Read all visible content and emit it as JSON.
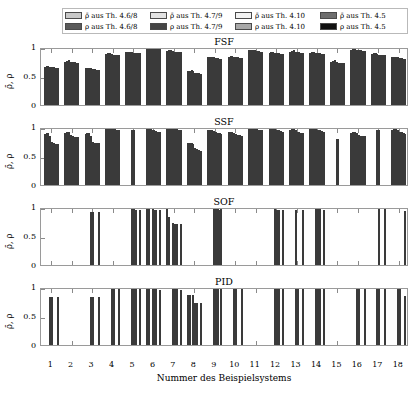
{
  "figure": {
    "xlabel": "Nummer des Beispielsystems",
    "ylabel": "ρ̄, ρ",
    "ytick_labels": [
      "1",
      "0.5",
      "0"
    ],
    "ytick_values": [
      1,
      0.5,
      0
    ]
  },
  "legend": {
    "entries": [
      {
        "label": "ρ̄ aus Th. 4.6/8",
        "color": "#c8c8c8",
        "series": "rhobar_468"
      },
      {
        "label": "ρ̄ aus Th. 4.7/9",
        "color": "#e2e2e2",
        "series": "rhobar_479"
      },
      {
        "label": "ρ̄ aus Th. 4.10",
        "color": "#f2f2f2",
        "series": "rhobar_410"
      },
      {
        "label": "ρ̄ aus Th. 4.5",
        "color": "#6e6e6e",
        "series": "rhobar_45"
      },
      {
        "label": "ρ aus Th. 4.6/8",
        "color": "#5a5a5a",
        "series": "rho_468"
      },
      {
        "label": "ρ aus Th. 4.7/9",
        "color": "#454545",
        "series": "rho_479"
      },
      {
        "label": "ρ aus Th. 4.10",
        "color": "#a8a8a8",
        "series": "rho_410"
      },
      {
        "label": "ρ aus Th. 4.5",
        "color": "#111111",
        "series": "rho_45"
      }
    ]
  },
  "chart_data": [
    {
      "type": "bar",
      "title": "FSF",
      "xlabel": "Nummer des Beispielsystems",
      "ylabel": "ρ̄, ρ",
      "ylim": [
        0,
        1
      ],
      "yticks": [
        0,
        0.5,
        1
      ],
      "grid": false,
      "legend_position": "top",
      "categories": [
        "1",
        "2",
        "3",
        "4",
        "5",
        "6",
        "7",
        "8",
        "9",
        "10",
        "11",
        "12",
        "13",
        "14",
        "15",
        "16",
        "17",
        "18"
      ],
      "series": [
        {
          "name": "ρ̄ aus Th. 4.6/8",
          "color": "#c8c8c8",
          "values": [
            0.66,
            0.75,
            0.63,
            0.88,
            0.91,
            0.98,
            0.93,
            0.58,
            0.82,
            0.83,
            0.94,
            0.9,
            0.92,
            0.9,
            0.75,
            0.95,
            0.88,
            0.82
          ]
        },
        {
          "name": "ρ̄ aus Th. 4.7/9",
          "color": "#e2e2e2",
          "values": [
            0.67,
            0.76,
            0.64,
            0.89,
            0.92,
            0.98,
            0.94,
            0.59,
            0.83,
            0.84,
            0.95,
            0.91,
            0.93,
            0.91,
            0.76,
            0.96,
            0.89,
            0.83
          ]
        },
        {
          "name": "ρ̄ aus Th. 4.10",
          "color": "#f2f2f2",
          "values": [
            0.67,
            0.77,
            0.64,
            0.89,
            0.92,
            0.99,
            0.94,
            0.6,
            0.83,
            0.84,
            0.95,
            0.91,
            0.94,
            0.91,
            0.77,
            0.96,
            0.9,
            0.83
          ]
        },
        {
          "name": "ρ̄ aus Th. 4.5",
          "color": "#6e6e6e",
          "values": [
            0.66,
            0.75,
            0.63,
            0.88,
            0.91,
            0.98,
            0.93,
            0.58,
            0.82,
            0.83,
            0.94,
            0.9,
            0.92,
            0.9,
            0.75,
            0.95,
            0.88,
            0.82
          ]
        },
        {
          "name": "ρ aus Th. 4.6/8",
          "color": "#5a5a5a",
          "values": [
            0.65,
            0.74,
            0.62,
            0.87,
            0.9,
            0.97,
            0.92,
            0.56,
            0.81,
            0.82,
            0.93,
            0.89,
            0.91,
            0.89,
            0.73,
            0.94,
            0.87,
            0.81
          ]
        },
        {
          "name": "ρ aus Th. 4.7/9",
          "color": "#454545",
          "values": [
            0.65,
            0.74,
            0.62,
            0.87,
            0.9,
            0.97,
            0.92,
            0.55,
            0.81,
            0.82,
            0.93,
            0.89,
            0.91,
            0.89,
            0.73,
            0.94,
            0.87,
            0.81
          ]
        },
        {
          "name": "ρ aus Th. 4.10",
          "color": "#a8a8a8",
          "values": [
            0.64,
            0.73,
            0.61,
            0.86,
            0.89,
            0.96,
            0.91,
            0.55,
            0.8,
            0.81,
            0.92,
            0.88,
            0.9,
            0.88,
            0.72,
            0.93,
            0.86,
            0.8
          ]
        },
        {
          "name": "ρ aus Th. 4.5",
          "color": "#111111",
          "values": [
            0.64,
            0.73,
            0.61,
            0.86,
            0.89,
            0.96,
            0.91,
            0.54,
            0.8,
            0.81,
            0.92,
            0.88,
            0.9,
            0.88,
            0.72,
            0.93,
            0.86,
            0.8
          ]
        }
      ]
    },
    {
      "type": "bar",
      "title": "SSF",
      "xlabel": "Nummer des Beispielsystems",
      "ylabel": "ρ̄, ρ",
      "ylim": [
        0,
        1
      ],
      "yticks": [
        0,
        0.5,
        1
      ],
      "grid": false,
      "legend_position": "top",
      "categories": [
        "1",
        "2",
        "3",
        "4",
        "5",
        "6",
        "7",
        "8",
        "9",
        "10",
        "11",
        "12",
        "13",
        "14",
        "15",
        "16",
        "17",
        "18"
      ],
      "series": [
        {
          "name": "ρ̄ aus Th. 4.6/8",
          "color": "#c8c8c8",
          "values": [
            0.88,
            0.9,
            0.88,
            0.99,
            0.0,
            0.96,
            0.99,
            0.72,
            0.94,
            0.91,
            0.98,
            0.97,
            0.95,
            0.97,
            0.0,
            0.9,
            0.0,
            0.95
          ]
        },
        {
          "name": "ρ̄ aus Th. 4.7/9",
          "color": "#e2e2e2",
          "values": [
            0.89,
            0.92,
            0.89,
            0.99,
            0.0,
            0.96,
            0.99,
            0.73,
            0.95,
            0.92,
            0.99,
            0.97,
            0.96,
            0.97,
            0.0,
            0.91,
            0.0,
            0.96
          ]
        },
        {
          "name": "ρ̄ aus Th. 4.10",
          "color": "#f2f2f2",
          "values": [
            0.89,
            0.92,
            0.89,
            0.99,
            0.0,
            0.96,
            0.99,
            0.73,
            0.95,
            0.92,
            0.99,
            0.98,
            0.96,
            0.97,
            0.0,
            0.91,
            0.0,
            0.96
          ]
        },
        {
          "name": "ρ̄ aus Th. 4.5",
          "color": "#6e6e6e",
          "values": [
            0.85,
            0.87,
            0.85,
            0.98,
            0.94,
            0.95,
            0.98,
            0.7,
            0.93,
            0.9,
            0.97,
            0.96,
            0.94,
            0.96,
            0.8,
            0.89,
            0.95,
            0.94
          ]
        },
        {
          "name": "ρ aus Th. 4.6/8",
          "color": "#5a5a5a",
          "values": [
            0.74,
            0.84,
            0.74,
            0.97,
            0.94,
            0.94,
            0.96,
            0.63,
            0.91,
            0.88,
            0.96,
            0.95,
            0.92,
            0.95,
            0.8,
            0.86,
            0.95,
            0.92
          ]
        },
        {
          "name": "ρ aus Th. 4.7/9",
          "color": "#454545",
          "values": [
            0.72,
            0.83,
            0.73,
            0.96,
            0.0,
            0.93,
            0.96,
            0.62,
            0.9,
            0.87,
            0.95,
            0.94,
            0.91,
            0.94,
            0.0,
            0.85,
            0.0,
            0.91
          ]
        },
        {
          "name": "ρ aus Th. 4.10",
          "color": "#a8a8a8",
          "values": [
            0.71,
            0.82,
            0.72,
            0.95,
            0.0,
            0.92,
            0.95,
            0.61,
            0.89,
            0.86,
            0.94,
            0.93,
            0.9,
            0.93,
            0.0,
            0.84,
            0.0,
            0.9
          ]
        },
        {
          "name": "ρ aus Th. 4.5",
          "color": "#111111",
          "values": [
            0.71,
            0.82,
            0.72,
            0.94,
            0.0,
            0.92,
            0.94,
            0.58,
            0.88,
            0.85,
            0.94,
            0.92,
            0.89,
            0.92,
            0.0,
            0.84,
            0.0,
            0.88
          ]
        }
      ]
    },
    {
      "type": "bar",
      "title": "SOF",
      "xlabel": "Nummer des Beispielsystems",
      "ylabel": "ρ̄, ρ",
      "ylim": [
        0,
        1
      ],
      "yticks": [
        0,
        0.5,
        1
      ],
      "grid": false,
      "legend_position": "top",
      "categories": [
        "1",
        "2",
        "3",
        "4",
        "5",
        "6",
        "7",
        "8",
        "9",
        "10",
        "11",
        "12",
        "13",
        "14",
        "15",
        "16",
        "17",
        "18"
      ],
      "series": [
        {
          "name": "ρ̄ aus Th. 4.6/8",
          "color": "#c8c8c8",
          "values": [
            0.0,
            0.0,
            0.0,
            0.0,
            0.0,
            0.97,
            0.96,
            0.0,
            0.0,
            0.0,
            0.0,
            0.0,
            0.0,
            0.0,
            0.0,
            0.0,
            0.0,
            0.0
          ]
        },
        {
          "name": "ρ̄ aus Th. 4.7/9",
          "color": "#e2e2e2",
          "values": [
            0.0,
            0.0,
            0.0,
            0.0,
            0.0,
            0.97,
            0.83,
            0.0,
            0.0,
            0.0,
            0.0,
            0.0,
            0.0,
            0.0,
            0.0,
            0.0,
            0.0,
            0.0
          ]
        },
        {
          "name": "ρ̄ aus Th. 4.10",
          "color": "#f2f2f2",
          "values": [
            0.0,
            0.0,
            0.0,
            0.0,
            0.0,
            0.0,
            0.0,
            0.0,
            0.0,
            0.0,
            0.0,
            0.0,
            0.0,
            0.0,
            0.0,
            0.0,
            0.0,
            0.0
          ]
        },
        {
          "name": "ρ̄ aus Th. 4.5",
          "color": "#6e6e6e",
          "values": [
            0.0,
            0.0,
            0.91,
            0.0,
            0.96,
            0.96,
            0.72,
            0.0,
            0.97,
            0.0,
            0.0,
            0.96,
            0.95,
            0.97,
            0.0,
            0.0,
            0.0,
            0.0
          ]
        },
        {
          "name": "ρ aus Th. 4.6/8",
          "color": "#5a5a5a",
          "values": [
            0.0,
            0.0,
            0.91,
            0.0,
            0.96,
            0.95,
            0.71,
            0.0,
            0.97,
            0.0,
            0.0,
            0.95,
            0.0,
            0.96,
            0.0,
            0.0,
            0.96,
            0.0
          ]
        },
        {
          "name": "ρ aus Th. 4.7/9",
          "color": "#454545",
          "values": [
            0.0,
            0.0,
            0.0,
            0.0,
            0.95,
            0.95,
            0.7,
            0.0,
            0.96,
            0.0,
            0.0,
            0.95,
            0.0,
            0.96,
            0.0,
            0.0,
            0.0,
            0.0
          ]
        },
        {
          "name": "ρ aus Th. 4.10",
          "color": "#a8a8a8",
          "values": [
            0.0,
            0.0,
            0.0,
            0.0,
            0.0,
            0.0,
            0.0,
            0.0,
            0.95,
            0.0,
            0.0,
            0.0,
            0.0,
            0.0,
            0.0,
            0.0,
            0.0,
            0.0
          ]
        },
        {
          "name": "ρ aus Th. 4.5",
          "color": "#111111",
          "values": [
            0.0,
            0.0,
            0.91,
            0.0,
            0.95,
            0.94,
            0.7,
            0.0,
            0.96,
            0.0,
            0.0,
            0.94,
            0.94,
            0.95,
            0.0,
            0.0,
            0.96,
            0.93
          ]
        }
      ]
    },
    {
      "type": "bar",
      "title": "PID",
      "xlabel": "Nummer des Beispielsystems",
      "ylabel": "ρ̄, ρ",
      "ylim": [
        0,
        1
      ],
      "yticks": [
        0,
        0.5,
        1
      ],
      "grid": false,
      "legend_position": "top",
      "categories": [
        "1",
        "2",
        "3",
        "4",
        "5",
        "6",
        "7",
        "8",
        "9",
        "10",
        "11",
        "12",
        "13",
        "14",
        "15",
        "16",
        "17",
        "18"
      ],
      "series": [
        {
          "name": "ρ̄ aus Th. 4.6/8",
          "color": "#c8c8c8",
          "values": [
            0.0,
            0.0,
            0.0,
            0.0,
            0.0,
            0.96,
            0.0,
            0.86,
            0.0,
            0.0,
            0.0,
            0.0,
            0.0,
            0.0,
            0.0,
            0.0,
            0.0,
            0.0
          ]
        },
        {
          "name": "ρ̄ aus Th. 4.7/9",
          "color": "#e2e2e2",
          "values": [
            0.0,
            0.0,
            0.0,
            0.0,
            0.0,
            0.96,
            0.0,
            0.86,
            0.0,
            0.0,
            0.0,
            0.0,
            0.0,
            0.0,
            0.0,
            0.0,
            0.0,
            0.0
          ]
        },
        {
          "name": "ρ̄ aus Th. 4.10",
          "color": "#f2f2f2",
          "values": [
            0.0,
            0.0,
            0.0,
            0.0,
            0.0,
            0.0,
            0.0,
            0.0,
            0.0,
            0.0,
            0.0,
            0.0,
            0.0,
            0.0,
            0.0,
            0.0,
            0.0,
            0.0
          ]
        },
        {
          "name": "ρ̄ aus Th. 4.5",
          "color": "#6e6e6e",
          "values": [
            0.82,
            0.0,
            0.82,
            0.99,
            0.98,
            0.96,
            0.96,
            0.86,
            0.99,
            0.97,
            0.0,
            0.98,
            0.97,
            0.98,
            0.0,
            0.97,
            0.97,
            0.98
          ]
        },
        {
          "name": "ρ aus Th. 4.6/8",
          "color": "#5a5a5a",
          "values": [
            0.82,
            0.0,
            0.82,
            0.99,
            0.98,
            0.96,
            0.96,
            0.72,
            0.99,
            0.97,
            0.0,
            0.98,
            0.97,
            0.97,
            0.0,
            0.97,
            0.97,
            0.98
          ]
        },
        {
          "name": "ρ aus Th. 4.7/9",
          "color": "#454545",
          "values": [
            0.0,
            0.0,
            0.0,
            0.0,
            0.98,
            0.96,
            0.96,
            0.72,
            0.99,
            0.0,
            0.0,
            0.98,
            0.0,
            0.97,
            0.0,
            0.0,
            0.0,
            0.0
          ]
        },
        {
          "name": "ρ aus Th. 4.10",
          "color": "#a8a8a8",
          "values": [
            0.0,
            0.0,
            0.0,
            0.0,
            0.0,
            0.0,
            0.0,
            0.0,
            0.0,
            0.0,
            0.0,
            0.0,
            0.0,
            0.0,
            0.0,
            0.0,
            0.0,
            0.0
          ]
        },
        {
          "name": "ρ aus Th. 4.5",
          "color": "#111111",
          "values": [
            0.82,
            0.0,
            0.82,
            0.99,
            0.98,
            0.95,
            0.95,
            0.72,
            0.99,
            0.97,
            0.0,
            0.98,
            0.96,
            0.97,
            0.0,
            0.97,
            0.97,
            0.84
          ]
        }
      ]
    }
  ]
}
